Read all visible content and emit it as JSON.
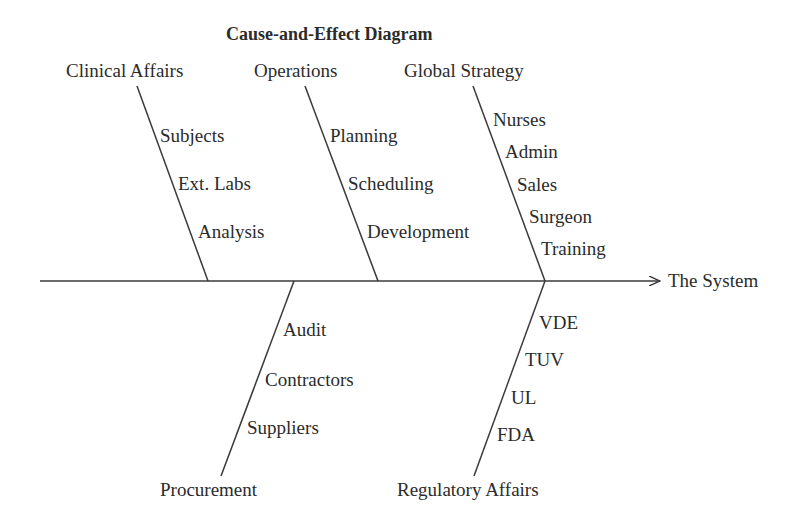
{
  "title": "Cause-and-Effect Diagram",
  "effect": "The System",
  "categories_top": [
    {
      "name": "Clinical Affairs",
      "causes": [
        "Subjects",
        "Ext. Labs",
        "Analysis"
      ]
    },
    {
      "name": "Operations",
      "causes": [
        "Planning",
        "Scheduling",
        "Development"
      ]
    },
    {
      "name": "Global Strategy",
      "causes": [
        "Nurses",
        "Admin",
        "Sales",
        "Surgeon",
        "Training"
      ]
    }
  ],
  "categories_bottom": [
    {
      "name": "Procurement",
      "causes": [
        "Audit",
        "Contractors",
        "Suppliers"
      ]
    },
    {
      "name": "Regulatory Affairs",
      "causes": [
        "VDE",
        "TUV",
        "UL",
        "FDA"
      ]
    }
  ],
  "colors": {
    "line": "#3a3a3a",
    "text": "#2b2b2b",
    "background": "#ffffff"
  }
}
